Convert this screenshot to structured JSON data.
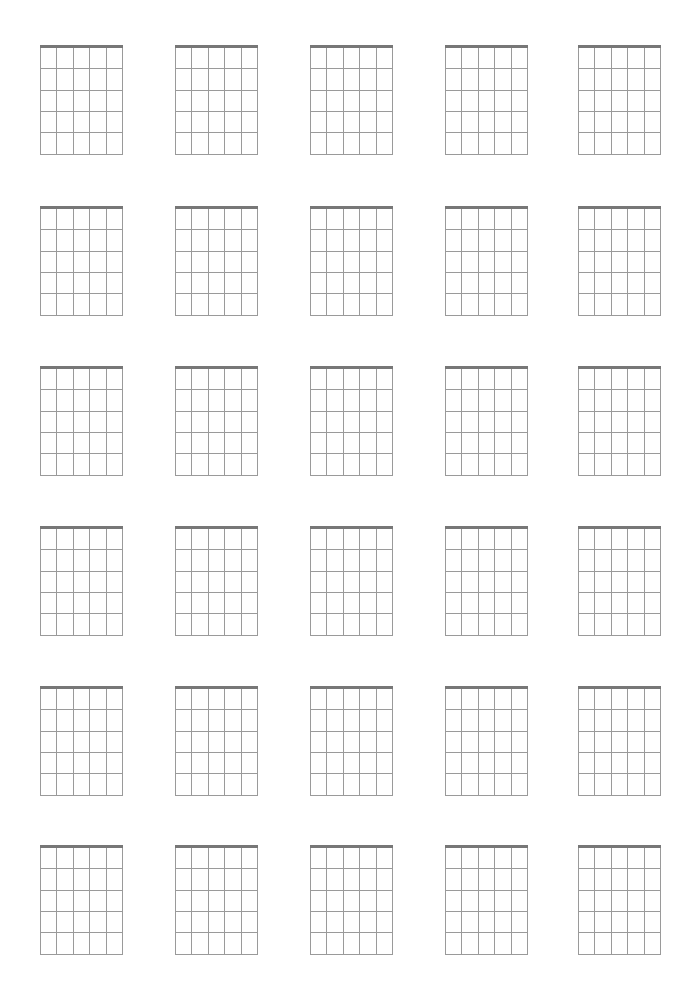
{
  "page": {
    "background": "#ffffff"
  },
  "layout": {
    "rows": 6,
    "columns": 5,
    "column_lefts": [
      40,
      175,
      310,
      445,
      578
    ],
    "row_tops": [
      45,
      206,
      366,
      526,
      686,
      845
    ],
    "diagram_width": 83,
    "diagram_height": 109
  },
  "diagram": {
    "strings": 6,
    "frets": 5,
    "nut_color": "#777777",
    "nut_thickness": 3,
    "grid_color": "#9a9a9a",
    "grid_thickness": 1
  }
}
